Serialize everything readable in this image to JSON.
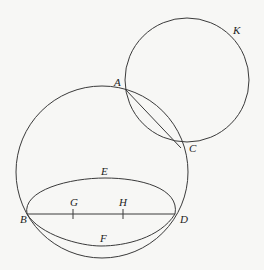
{
  "diagram": {
    "background": "#f7f7f5",
    "stroke_color": "#3a3a3a",
    "labels": {
      "K": "K",
      "A": "A",
      "C": "C",
      "E": "E",
      "B": "B",
      "G": "G",
      "H": "H",
      "D": "D",
      "F": "F"
    },
    "circles": [
      {
        "name": "circle-K",
        "cx": 187,
        "cy": 80,
        "r": 62
      },
      {
        "name": "circle-large",
        "cx": 102,
        "cy": 172,
        "r": 86
      }
    ],
    "points": {
      "A": [
        125,
        89
      ],
      "C": [
        181,
        148
      ],
      "B": [
        27,
        214
      ],
      "D": [
        175,
        214
      ],
      "G": [
        73,
        214
      ],
      "H": [
        123,
        214
      ]
    }
  }
}
